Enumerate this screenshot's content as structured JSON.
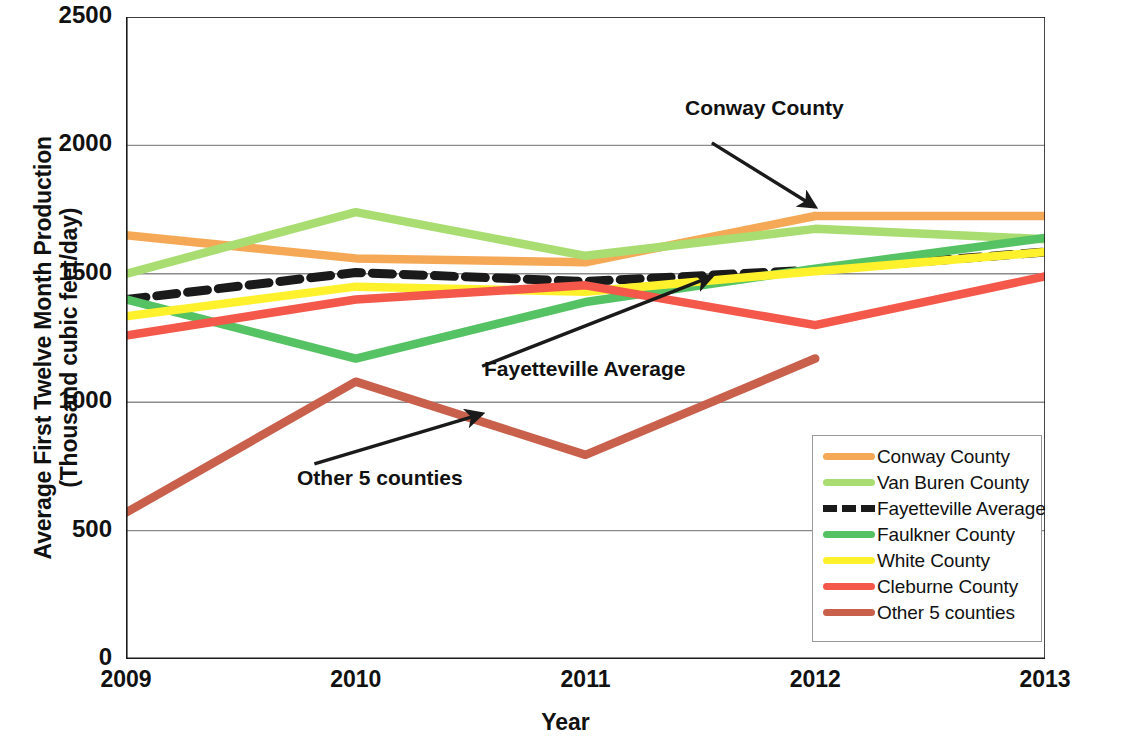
{
  "chart_data": {
    "type": "line",
    "title": "",
    "xlabel": "Year",
    "ylabel": "Average First Twelve Month Production\n(Thousand cubic feet/day)",
    "x": [
      2009,
      2010,
      2011,
      2012,
      2013
    ],
    "xticklabels": [
      "2009",
      "2010",
      "2011",
      "2012",
      "2013"
    ],
    "yticklabels": [
      "0",
      "500",
      "1000",
      "1500",
      "2000",
      "2500"
    ],
    "yticks": [
      0,
      500,
      1000,
      1500,
      2000,
      2500
    ],
    "xlim": [
      2009,
      2013
    ],
    "ylim": [
      0,
      2500
    ],
    "grid": "horizontal",
    "legend_position": "lower right",
    "series": [
      {
        "name": "Conway County",
        "color": "#F5A956",
        "style": "solid",
        "x": [
          2009,
          2010,
          2011,
          2012,
          2013
        ],
        "values": [
          1650,
          1560,
          1545,
          1725,
          1725
        ]
      },
      {
        "name": "Van Buren County",
        "color": "#A9DD71",
        "style": "solid",
        "x": [
          2009,
          2010,
          2011,
          2012,
          2013
        ],
        "values": [
          1500,
          1740,
          1570,
          1675,
          1635
        ]
      },
      {
        "name": "Fayetteville Average",
        "color": "#1A1A1A",
        "style": "dashed",
        "x": [
          2009,
          2010,
          2011,
          2012,
          2013
        ],
        "values": [
          1400,
          1505,
          1470,
          1515,
          1585
        ]
      },
      {
        "name": "Faulkner County",
        "color": "#55C263",
        "style": "solid",
        "x": [
          2009,
          2010,
          2011,
          2012,
          2013
        ],
        "values": [
          1400,
          1170,
          1390,
          1520,
          1640
        ]
      },
      {
        "name": "White County",
        "color": "#FFF22D",
        "style": "solid",
        "x": [
          2009,
          2010,
          2011,
          2012,
          2013
        ],
        "values": [
          1335,
          1450,
          1430,
          1510,
          1585
        ]
      },
      {
        "name": "Cleburne County",
        "color": "#F4584A",
        "style": "solid",
        "x": [
          2009,
          2010,
          2011,
          2012,
          2013
        ],
        "values": [
          1260,
          1400,
          1455,
          1300,
          1490
        ]
      },
      {
        "name": "Other 5 counties",
        "color": "#C8604C",
        "style": "solid",
        "x": [
          2009,
          2010,
          2011,
          2012
        ],
        "values": [
          570,
          1080,
          795,
          1170
        ]
      }
    ],
    "annotations": [
      {
        "text": "Conway County",
        "x": 2011.55,
        "y": 2010,
        "arrow_to_x": 2012.0,
        "arrow_to_y": 1760
      },
      {
        "text": "Fayetteville Average",
        "x": 2010.55,
        "y": 1140,
        "arrow_to_x": 2011.55,
        "arrow_to_y": 1490
      },
      {
        "text": "Other 5 counties",
        "x": 2009.82,
        "y": 760,
        "arrow_to_x": 2010.55,
        "arrow_to_y": 955
      }
    ]
  },
  "legend": {
    "items": [
      {
        "label": "Conway County",
        "color": "#F5A956",
        "style": "solid"
      },
      {
        "label": "Van Buren County",
        "color": "#A9DD71",
        "style": "solid"
      },
      {
        "label": "Fayetteville Average",
        "color": "#1A1A1A",
        "style": "dashed"
      },
      {
        "label": "Faulkner County",
        "color": "#55C263",
        "style": "solid"
      },
      {
        "label": "White County",
        "color": "#FFF22D",
        "style": "solid"
      },
      {
        "label": "Cleburne County",
        "color": "#F4584A",
        "style": "solid"
      },
      {
        "label": "Other 5 counties",
        "color": "#C8604C",
        "style": "solid"
      }
    ]
  },
  "axis_colors": {
    "axis_line": "#1a1a1a",
    "grid_line": "#8a8a8a"
  }
}
